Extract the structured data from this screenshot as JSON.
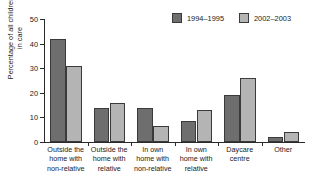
{
  "chart_data": {
    "type": "bar",
    "title": "",
    "xlabel": "",
    "ylabel": "Percentage of all children\nin care",
    "ylim": [
      0,
      50
    ],
    "yticks": [
      0,
      10,
      20,
      30,
      40,
      50
    ],
    "ytick_labels": [
      "0",
      "10",
      "20",
      "30",
      "40",
      "50"
    ],
    "grid": false,
    "legend_position": "top-right",
    "categories": [
      "Outside the\nhome with\nnon-relative",
      "Outside the\nhome with\nrelative",
      "In own\nhome with\nnon-relative",
      "In own\nhome with\nrelative",
      "Daycare\ncentre",
      "Other"
    ],
    "series": [
      {
        "name": "1994–1995",
        "color": "#6e6e6e",
        "values": [
          42,
          14,
          14,
          8.5,
          19,
          2
        ]
      },
      {
        "name": "2002–2003",
        "color": "#b4b4b4",
        "values": [
          31,
          16,
          6.5,
          13,
          26,
          4
        ]
      }
    ]
  },
  "legend": {
    "items": [
      {
        "label": "1994–1995"
      },
      {
        "label": "2002–2003"
      }
    ]
  }
}
